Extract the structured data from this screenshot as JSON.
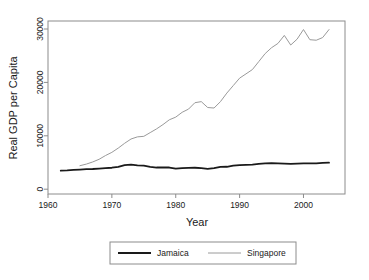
{
  "chart_data": {
    "type": "line",
    "title": "",
    "xlabel": "Year",
    "ylabel": "Real GDP per Capita",
    "xlim": [
      1960,
      2006.5
    ],
    "ylim": [
      -900,
      31500
    ],
    "xticks": [
      1960,
      1970,
      1980,
      1990,
      2000
    ],
    "xtick_labels": [
      "1960",
      "1970",
      "1980",
      "1990",
      "2000"
    ],
    "yticks": [
      0,
      10000,
      20000,
      30000
    ],
    "ytick_labels": [
      "0",
      "10000",
      "20000",
      "30000"
    ],
    "grid": false,
    "legend_position": "bottom-outside",
    "series": [
      {
        "name": "Jamaica",
        "color": "#1a1a1a",
        "line_width": 1.8,
        "x": [
          1962,
          1963,
          1964,
          1965,
          1966,
          1967,
          1968,
          1969,
          1970,
          1971,
          1972,
          1973,
          1974,
          1975,
          1976,
          1977,
          1978,
          1979,
          1980,
          1981,
          1982,
          1983,
          1984,
          1985,
          1986,
          1987,
          1988,
          1989,
          1990,
          1991,
          1992,
          1993,
          1994,
          1995,
          1996,
          1997,
          1998,
          1999,
          2000,
          2001,
          2002,
          2003,
          2004
        ],
        "values": [
          3480,
          3520,
          3600,
          3680,
          3760,
          3780,
          3860,
          3940,
          4020,
          4180,
          4520,
          4620,
          4460,
          4400,
          4200,
          4060,
          4080,
          4060,
          3860,
          3960,
          4000,
          4020,
          3940,
          3820,
          3940,
          4180,
          4200,
          4400,
          4520,
          4560,
          4620,
          4760,
          4840,
          4860,
          4820,
          4780,
          4760,
          4800,
          4840,
          4820,
          4840,
          4920,
          4960
        ]
      },
      {
        "name": "Singapore",
        "color": "#9a9a9a",
        "line_width": 1.0,
        "x": [
          1965,
          1966,
          1967,
          1968,
          1969,
          1970,
          1971,
          1972,
          1973,
          1974,
          1975,
          1976,
          1977,
          1978,
          1979,
          1980,
          1981,
          1982,
          1983,
          1984,
          1985,
          1986,
          1987,
          1988,
          1989,
          1990,
          1991,
          1992,
          1993,
          1994,
          1995,
          1996,
          1997,
          1998,
          1999,
          2000,
          2001,
          2002,
          2003,
          2004
        ],
        "values": [
          4400,
          4700,
          5100,
          5600,
          6300,
          6900,
          7700,
          8600,
          9400,
          9800,
          9900,
          10600,
          11300,
          12100,
          13000,
          13500,
          14400,
          15000,
          16200,
          16400,
          15300,
          15200,
          16400,
          18000,
          19400,
          20800,
          21600,
          22400,
          23900,
          25400,
          26500,
          27300,
          28800,
          27000,
          28100,
          29900,
          28000,
          27900,
          28400,
          29900
        ]
      }
    ]
  },
  "legend": {
    "items": [
      {
        "label": "Jamaica"
      },
      {
        "label": "Singapore"
      }
    ]
  }
}
